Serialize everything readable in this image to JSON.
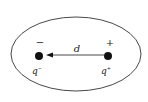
{
  "diagram": {
    "type": "electric dipole in closed surface",
    "surface": {
      "shape": "ellipse"
    },
    "charges": [
      {
        "sign_label": "−",
        "name_label": "q",
        "superscript": "−",
        "position": "left"
      },
      {
        "sign_label": "+",
        "name_label": "q",
        "superscript": "+",
        "position": "right"
      }
    ],
    "separation": {
      "label": "d",
      "arrow_direction": "left"
    },
    "colors": {
      "stroke": "#333333",
      "charge": "#111111",
      "background": "#ffffff"
    }
  }
}
